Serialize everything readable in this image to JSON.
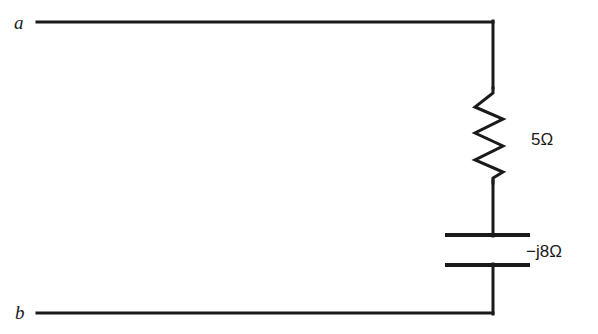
{
  "figure": {
    "kind": "electrical-circuit-schematic",
    "background_color": "#ffffff",
    "line_color": "#1a1a1a",
    "line_width": 3
  },
  "terminals": [
    {
      "id": "a",
      "label": "a",
      "x": 37,
      "y": 22
    },
    {
      "id": "b",
      "label": "b",
      "x": 37,
      "y": 313
    }
  ],
  "components": [
    {
      "id": "resistor",
      "type": "resistor",
      "symbol": "zigzag",
      "label": "5Ω",
      "value": "5",
      "unit": "Ω",
      "label_x": 531,
      "label_y": 139,
      "axis_x": 493,
      "y_top": 85,
      "y_bottom": 182,
      "peak_left_x": 475,
      "peak_right_x": 503
    },
    {
      "id": "capacitor",
      "type": "capacitor",
      "symbol": "parallel-plates",
      "label": "−j8Ω",
      "value": "-j8",
      "unit": "Ω",
      "label_x": 526,
      "label_y": 251,
      "axis_x": 493,
      "plate_top_y": 235,
      "plate_bottom_y": 265,
      "plate_x_start": 445,
      "plate_x_end": 530
    }
  ],
  "wires": [
    {
      "id": "top-wire",
      "x1": 37,
      "y1": 22,
      "x2": 493,
      "y2": 22
    },
    {
      "id": "bottom-wire",
      "x1": 37,
      "y1": 313,
      "x2": 493,
      "y2": 313
    },
    {
      "id": "right-upper-lead",
      "x1": 493,
      "y1": 22,
      "x2": 493,
      "y2": 86
    },
    {
      "id": "mid-lead",
      "x1": 493,
      "y1": 181,
      "x2": 493,
      "y2": 235
    },
    {
      "id": "right-lower-lead",
      "x1": 493,
      "y1": 265,
      "x2": 493,
      "y2": 313
    }
  ],
  "paths": {
    "resistor_zigzag": "M 493,86 L 493,93 L 475,107 L 503,119 L 475,133 L 503,146 L 475,160 L 493,171 L 493,181"
  }
}
